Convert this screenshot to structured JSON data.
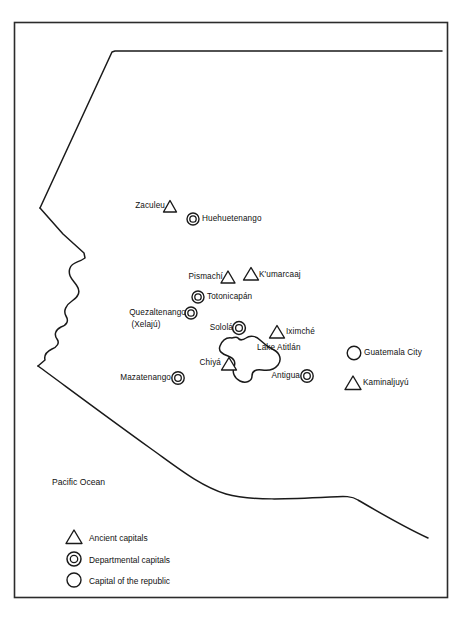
{
  "map": {
    "title": "Ancient and modern capitals of highland Guatemala",
    "frame": {
      "stroke": "#2b2b2b"
    },
    "ocean_label": "Pacific Ocean",
    "lake_label": "Lake Atitlán",
    "colors": {
      "line": "#1a1a1a",
      "frame": "#2b2b2b",
      "text": "#111111",
      "background": "#ffffff"
    },
    "places": [
      {
        "name": "Zaculeu",
        "symbol": "triangle",
        "label_side": "left",
        "sx": 170,
        "sy": 207,
        "lx": 165,
        "ly": 201
      },
      {
        "name": "Huehuetenango",
        "symbol": "double-circle",
        "label_side": "right",
        "sx": 193,
        "sy": 219,
        "lx": 202,
        "ly": 214
      },
      {
        "name": "Pismachí",
        "symbol": "triangle",
        "label_side": "left",
        "sx": 228,
        "sy": 278,
        "lx": 223,
        "ly": 272
      },
      {
        "name": "K'umarcaaj",
        "symbol": "triangle",
        "label_side": "right",
        "sx": 250,
        "sy": 275,
        "lx": 259,
        "ly": 270
      },
      {
        "name": "Totonicapán",
        "symbol": "double-circle",
        "label_side": "right",
        "sx": 198,
        "sy": 297,
        "lx": 207,
        "ly": 292
      },
      {
        "name": "Quezaltenango",
        "symbol": "double-circle",
        "label_side": "left",
        "sx": 191,
        "sy": 313,
        "lx": 186,
        "ly": 308,
        "sublabel": "(Xelajú)"
      },
      {
        "name": "Sololá",
        "symbol": "double-circle",
        "label_side": "left",
        "sx": 238,
        "sy": 329,
        "lx": 233,
        "ly": 323
      },
      {
        "name": "Iximché",
        "symbol": "triangle",
        "label_side": "right",
        "sx": 277,
        "sy": 332,
        "lx": 286,
        "ly": 327
      },
      {
        "name": "Chiyá",
        "symbol": "triangle",
        "label_side": "left",
        "sx": 228,
        "sy": 365,
        "lx": 221,
        "ly": 358
      },
      {
        "name": "Mazatenango",
        "symbol": "double-circle",
        "label_side": "left",
        "sx": 178,
        "sy": 378,
        "lx": 173,
        "ly": 373
      },
      {
        "name": "Antigua",
        "symbol": "double-circle",
        "label_side": "left",
        "sx": 307,
        "sy": 376,
        "lx": 302,
        "ly": 371
      },
      {
        "name": "Guatemala City",
        "symbol": "circle",
        "label_side": "right",
        "sx": 354,
        "sy": 353,
        "lx": 364,
        "ly": 348
      },
      {
        "name": "Kaminaljuyú",
        "symbol": "triangle",
        "label_side": "right",
        "sx": 353,
        "sy": 383,
        "lx": 363,
        "ly": 378
      }
    ],
    "legend": [
      {
        "symbol": "triangle",
        "label": "Ancient capitals"
      },
      {
        "symbol": "double-circle",
        "label": "Departmental capitals"
      },
      {
        "symbol": "circle",
        "label": "Capital of the republic"
      }
    ]
  }
}
